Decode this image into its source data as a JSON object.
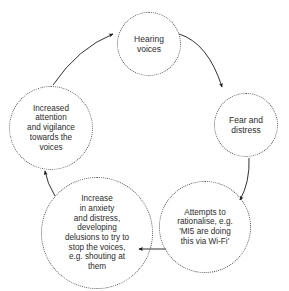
{
  "diagram": {
    "type": "cycle",
    "title": "",
    "background_color": "#ffffff",
    "node_border_color": "#555555",
    "node_border_style": "dotted",
    "text_color": "#2b2b2b",
    "arrow_color": "#1a1a1a",
    "direction": "clockwise",
    "nodes": [
      {
        "id": "hearing-voices",
        "label": "Hearing\nvoices",
        "position": "top"
      },
      {
        "id": "fear-distress",
        "label": "Fear and\ndistress",
        "position": "right"
      },
      {
        "id": "attempts-rationalise",
        "label": "Attempts to\nrationalise, e.g.\n'MI5 are doing\nthis via Wi-Fi'",
        "position": "bottom-right"
      },
      {
        "id": "increase-anxiety",
        "label": "Increase\nin anxiety\nand distress,\ndeveloping\ndelusions to try to\nstop the voices,\ne.g. shouting at\nthem",
        "position": "bottom-left"
      },
      {
        "id": "increased-attention",
        "label": "Increased\nattention\nand vigilance\ntowards the\nvoices",
        "position": "left"
      }
    ],
    "arrows": [
      {
        "id": "arrow-hearing-to-fear",
        "from": "hearing-voices",
        "to": "fear-distress"
      },
      {
        "id": "arrow-fear-to-attempts",
        "from": "fear-distress",
        "to": "attempts-rationalise"
      },
      {
        "id": "arrow-attempts-to-increase",
        "from": "attempts-rationalise",
        "to": "increase-anxiety"
      },
      {
        "id": "arrow-increase-to-attention",
        "from": "increase-anxiety",
        "to": "increased-attention"
      },
      {
        "id": "arrow-attention-to-hearing",
        "from": "increased-attention",
        "to": "hearing-voices"
      }
    ]
  }
}
